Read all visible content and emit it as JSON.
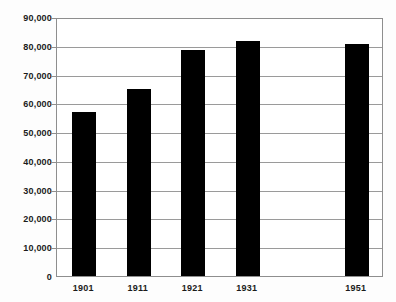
{
  "chart_data": {
    "type": "bar",
    "title": "",
    "subtitle": "",
    "xlabel": "",
    "ylabel": "",
    "categories": [
      "1901",
      "1911",
      "1921",
      "1931",
      "1941",
      "1951"
    ],
    "values": [
      57000,
      65000,
      78500,
      81500,
      null,
      80500
    ],
    "ylim": [
      0,
      90000
    ],
    "ytick_step": 10000,
    "ytick_labels": [
      "90,000",
      "80,000",
      "70,000",
      "60,000",
      "50,000",
      "40,000",
      "30,000",
      "20,000",
      "10,000",
      "0"
    ],
    "ytick_values": [
      90000,
      80000,
      70000,
      60000,
      50000,
      40000,
      30000,
      20000,
      10000,
      0
    ],
    "grid": true,
    "legend": "none",
    "series": [
      {
        "name": "",
        "values": [
          57000,
          65000,
          78500,
          81500,
          null,
          80500
        ]
      }
    ],
    "colors": {
      "bar": "#000000",
      "gridline": "#9a9a9a",
      "axis": "#8e8e8e",
      "text": "#1b1b1b",
      "background": "#ffffff"
    }
  }
}
